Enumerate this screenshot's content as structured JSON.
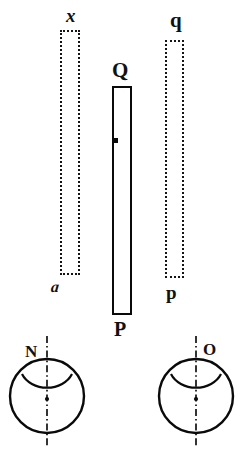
{
  "figure": {
    "background_color": "#ffffff",
    "ink_color": "#111111",
    "width": 247,
    "height": 452
  },
  "labels": {
    "left_bar_top": "x",
    "left_bar_bottom": "a",
    "center_bar_top": "Q",
    "center_bar_bottom": "P",
    "right_bar_top": "q",
    "right_bar_bottom": "p",
    "left_eye": "N",
    "right_eye": "O"
  },
  "objects": {
    "left_bar": {
      "name": "x-a-bar",
      "style": "dotted-outline",
      "top_label": "x",
      "bottom_label": "a"
    },
    "center_bar": {
      "name": "Q-P-bar",
      "style": "solid-outline",
      "top_label": "Q",
      "bottom_label": "P"
    },
    "right_bar": {
      "name": "q-p-bar",
      "style": "dotted-outline",
      "top_label": "q",
      "bottom_label": "p"
    }
  },
  "eyes": [
    {
      "name": "left-eye",
      "label": "N",
      "axis": "dash-dot-vertical"
    },
    {
      "name": "right-eye",
      "label": "O",
      "axis": "dash-dot-vertical"
    }
  ],
  "caption": {
    "text": "",
    "visible": false
  }
}
